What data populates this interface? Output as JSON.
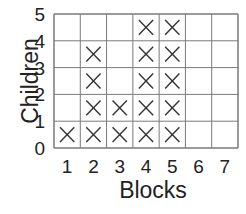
{
  "chart_data": {
    "type": "table",
    "subtype": "line-plot-x-marks",
    "title": "",
    "xlabel": "Blocks",
    "ylabel": "Children",
    "categories": [
      "1",
      "2",
      "3",
      "4",
      "5",
      "6",
      "7"
    ],
    "values": [
      1,
      4,
      2,
      5,
      5,
      0,
      0
    ],
    "y_ticks": [
      "0",
      "1",
      "2",
      "3",
      "4",
      "5"
    ],
    "ylim": [
      0,
      5
    ],
    "grid": true,
    "marker": "X"
  },
  "colors": {
    "grid": "#7a7a7a",
    "mark": "#333333",
    "text": "#222222"
  }
}
